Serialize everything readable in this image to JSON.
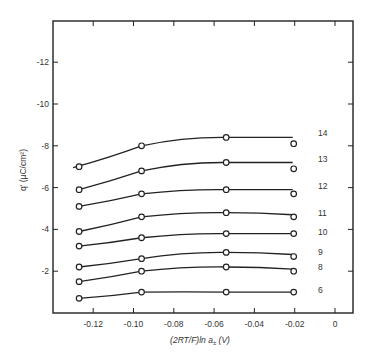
{
  "chart_data": {
    "type": "line",
    "title": "",
    "xlabel": "(2RT/F)ln a± (V)",
    "xlabel_parts": {
      "main": "(2RT/F)ln a",
      "sub": "±",
      "unit": " (V)"
    },
    "ylabel": "q' (µC/cm²)",
    "xlim": [
      -0.14,
      0.005
    ],
    "ylim": [
      0,
      -14
    ],
    "x_ticks": [
      -0.12,
      -0.1,
      -0.08,
      -0.06,
      -0.04,
      -0.02,
      0
    ],
    "x_tick_labels": [
      "-0.12",
      "-0.10",
      "-0.08",
      "-0.06",
      "-0.04",
      "-0.02",
      "0"
    ],
    "y_ticks": [
      -2,
      -4,
      -6,
      -8,
      -10,
      -12
    ],
    "y_tick_labels": [
      "-2",
      "-4",
      "-6",
      "-8",
      "-10",
      "-12"
    ],
    "grid": false,
    "legend": "inline labels at right end of each curve",
    "marker": "open circle",
    "x": [
      -0.127,
      -0.096,
      -0.054,
      -0.0205
    ],
    "series": [
      {
        "name": "14",
        "values": [
          -7.0,
          -8.0,
          -8.4,
          -8.1
        ],
        "curve_end": -8.4
      },
      {
        "name": "13",
        "values": [
          -5.9,
          -6.8,
          -7.2,
          -6.9
        ],
        "curve_end": -7.2
      },
      {
        "name": "12",
        "values": [
          -5.1,
          -5.7,
          -5.9,
          -5.7
        ],
        "curve_end": -5.9
      },
      {
        "name": "11",
        "values": [
          -3.9,
          -4.6,
          -4.8,
          -4.6
        ],
        "curve_end": -4.7
      },
      {
        "name": "10",
        "values": [
          -3.2,
          -3.6,
          -3.8,
          -3.8
        ],
        "curve_end": -3.8
      },
      {
        "name": "9",
        "values": [
          -2.2,
          -2.6,
          -2.9,
          -2.7
        ],
        "curve_end": -2.8
      },
      {
        "name": "8",
        "values": [
          -1.5,
          -2.0,
          -2.2,
          -2.0
        ],
        "curve_end": -2.1
      },
      {
        "name": "6",
        "values": [
          -0.7,
          -1.0,
          -1.0,
          -1.0
        ],
        "curve_end": -1.0
      }
    ]
  }
}
